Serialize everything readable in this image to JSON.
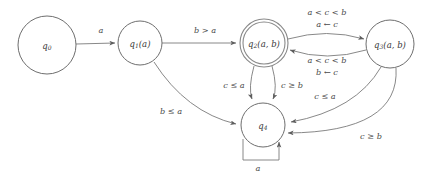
{
  "diagram": {
    "type": "finite-state-automaton",
    "title": "",
    "colors": {
      "background": "#ffffff",
      "node_stroke": "#6e6e6e",
      "accepting_stroke": "#8a8a8a",
      "edge_stroke": "#7a7a7a",
      "text": "#3a3a3a"
    },
    "states": [
      {
        "id": "q0",
        "label": "q₀",
        "base": "q",
        "sub": "0",
        "args": "",
        "cx": 47,
        "cy": 45,
        "r": 29,
        "accepting": false,
        "initial": false
      },
      {
        "id": "q1",
        "label": "q₁(a)",
        "base": "q",
        "sub": "1",
        "args": "(a)",
        "cx": 140,
        "cy": 43,
        "r": 22,
        "accepting": false,
        "initial": false
      },
      {
        "id": "q2",
        "label": "q₂(a, b)",
        "base": "q",
        "sub": "2",
        "args": "(a, b)",
        "cx": 264,
        "cy": 43,
        "r": 24,
        "accepting": true,
        "initial": false
      },
      {
        "id": "q3",
        "label": "q₃(a, b)",
        "base": "q",
        "sub": "3",
        "args": "(a, b)",
        "cx": 390,
        "cy": 44,
        "r": 24,
        "accepting": false,
        "initial": false
      },
      {
        "id": "q4",
        "label": "q₄",
        "base": "q",
        "sub": "4",
        "args": "",
        "cx": 263,
        "cy": 125,
        "r": 22,
        "accepting": false,
        "initial": false
      }
    ],
    "transitions": [
      {
        "id": "t-q0-q1",
        "from": "q0",
        "to": "q1",
        "label": "a",
        "label2": "",
        "label_x": 101,
        "label_y": 31,
        "label2_x": 0,
        "label2_y": 0
      },
      {
        "id": "t-q1-q2",
        "from": "q1",
        "to": "q2",
        "label": "b > a",
        "label2": "",
        "label_x": 205,
        "label_y": 31,
        "label2_x": 0,
        "label2_y": 0
      },
      {
        "id": "t-q2-q3",
        "from": "q2",
        "to": "q3",
        "label": "a < c < b",
        "label2": "a ← c",
        "label_x": 327,
        "label_y": 13,
        "label2_x": 327,
        "label2_y": 25
      },
      {
        "id": "t-q3-q2",
        "from": "q3",
        "to": "q2",
        "label": "a < c < b",
        "label2": "b ← c",
        "label_x": 327,
        "label_y": 61,
        "label2_x": 327,
        "label2_y": 73
      },
      {
        "id": "t-q2-q4-left",
        "from": "q2",
        "to": "q4",
        "label": "c ≤ a",
        "label2": "",
        "label_x": 237,
        "label_y": 86,
        "label2_x": 0,
        "label2_y": 0
      },
      {
        "id": "t-q2-q4-right",
        "from": "q2",
        "to": "q4",
        "label": "c ≥ b",
        "label2": "",
        "label_x": 290,
        "label_y": 86,
        "label2_x": 0,
        "label2_y": 0
      },
      {
        "id": "t-q1-q4",
        "from": "q1",
        "to": "q4",
        "label": "b ≤ a",
        "label2": "",
        "label_x": 173,
        "label_y": 113,
        "label2_x": 0,
        "label2_y": 0
      },
      {
        "id": "t-q3-q4-upper",
        "from": "q3",
        "to": "q4",
        "label": "c ≤ a",
        "label2": "",
        "label_x": 325,
        "label_y": 99,
        "label2_x": 0,
        "label2_y": 0
      },
      {
        "id": "t-q3-q4-lower",
        "from": "q3",
        "to": "q4",
        "label": "c ≥ b",
        "label2": "",
        "label_x": 369,
        "label_y": 138,
        "label2_x": 0,
        "label2_y": 0
      },
      {
        "id": "t-q4-q4-self",
        "from": "q4",
        "to": "q4",
        "label": "a",
        "label2": "",
        "label_x": 250,
        "label_y": 167,
        "label2_x": 0,
        "label2_y": 0
      }
    ]
  }
}
